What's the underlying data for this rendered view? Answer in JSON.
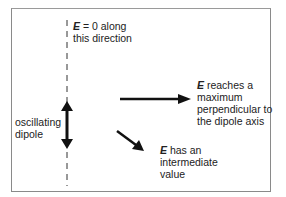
{
  "diagram": {
    "labels": {
      "top": {
        "symbol": "E",
        "line1_rest": " = 0 along",
        "line2": "this direction"
      },
      "dipole": {
        "line1": "oscillating",
        "line2": "dipole"
      },
      "perpendicular": {
        "symbol": "E",
        "line1_rest": " reaches a",
        "line2": "maximum",
        "line3": "perpendicular to",
        "line4": "the dipole axis"
      },
      "diagonal": {
        "symbol": "E",
        "line1_rest": " has an",
        "line2": "intermediate",
        "line3": "value"
      }
    },
    "colors": {
      "ink": "#111111",
      "frame": "#8a8a8a",
      "background": "#ffffff"
    }
  }
}
